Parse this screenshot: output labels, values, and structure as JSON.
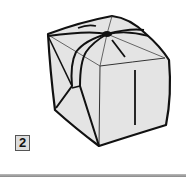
{
  "figure": {
    "step_number": "2",
    "colors": {
      "paper": "#e4e4e4",
      "outline": "#111111",
      "crease": "#444444",
      "badge_fill": "#dddddd",
      "rule": "#999999"
    }
  }
}
